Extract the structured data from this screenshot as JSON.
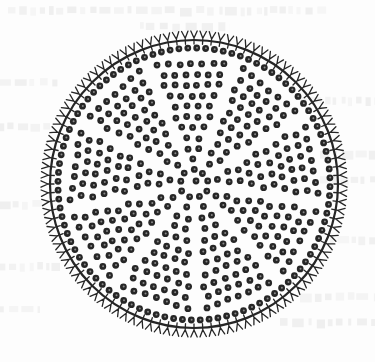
{
  "figure": {
    "colors": {
      "background": "#fdfdfd",
      "ink": "#262626",
      "areola_center": "#8a8a8a",
      "bleed_through": "#e9e9e9"
    },
    "geometry": {
      "center_x": 194,
      "center_y": 184,
      "rim_radius": 144,
      "rim_stroke": 2.2,
      "spike_count": 104,
      "spike_outer_length": 9,
      "spike_fork_spread": 3.2,
      "spike_inner_length": 4,
      "dot_radius": 3.4,
      "dot_center_radius": 1.0,
      "sectors": 9,
      "ring_spacing": 10.6,
      "dot_spacing": 11.2
    }
  }
}
